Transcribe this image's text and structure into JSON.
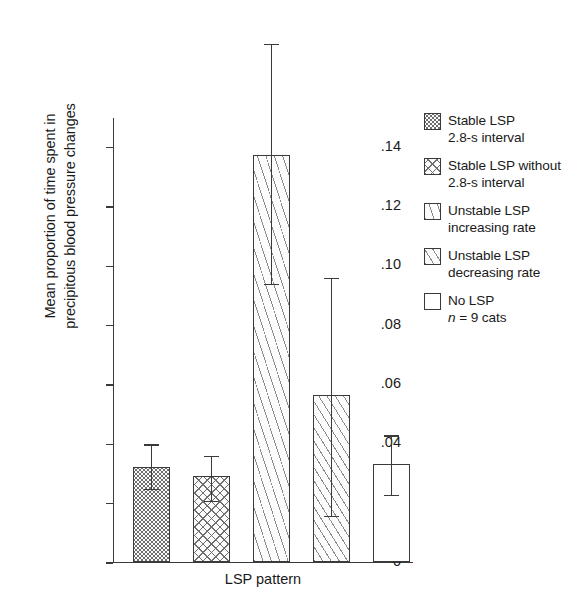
{
  "chart_data": {
    "type": "bar",
    "title": "",
    "xlabel": "LSP pattern",
    "ylabel": "Mean proportion of time spent in\nprecipitous blood pressure changes",
    "categories": [
      "Stable LSP 2.8-s interval",
      "Stable LSP without 2.8-s interval",
      "Unstable LSP increasing rate",
      "Unstable LSP decreasing rate",
      "No LSP"
    ],
    "values": [
      0.032,
      0.029,
      0.137,
      0.056,
      0.033
    ],
    "error_upper": [
      0.04,
      0.036,
      0.175,
      0.096,
      0.043
    ],
    "error_lower": [
      0.025,
      0.021,
      0.094,
      0.016,
      0.023
    ],
    "ylim": [
      0,
      0.15
    ],
    "ytick_values": [
      0,
      0.02,
      0.04,
      0.06,
      0.08,
      0.1,
      0.12,
      0.14
    ],
    "ytick_labels": [
      "0",
      ".02",
      ".04",
      ".06",
      ".08",
      ".10",
      ".12",
      ".14"
    ],
    "grid": false,
    "legend_position": "right",
    "patterns": [
      "dots",
      "cross-hatch",
      "diagonal-steep",
      "diagonal-shallow",
      "none"
    ],
    "sample_note": "n = 9 cats"
  },
  "axes": {
    "y_title": "Mean proportion of time spent in\nprecipitous blood pressure changes",
    "x_title": "LSP pattern",
    "ticks": [
      {
        "label": ".14",
        "value": 0.14
      },
      {
        "label": ".12",
        "value": 0.12
      },
      {
        "label": ".10",
        "value": 0.1
      },
      {
        "label": ".08",
        "value": 0.08
      },
      {
        "label": ".06",
        "value": 0.06
      },
      {
        "label": ".04",
        "value": 0.04
      },
      {
        "label": ".02",
        "value": 0.02
      },
      {
        "label": "0",
        "value": 0
      }
    ]
  },
  "legend": {
    "items": [
      {
        "line1": "Stable LSP",
        "line2": "2.8-s interval",
        "pattern": "dots"
      },
      {
        "line1": "Stable LSP without",
        "line2": "2.8-s interval",
        "pattern": "cross-hatch"
      },
      {
        "line1": "Unstable LSP",
        "line2": "increasing rate",
        "pattern": "diagonal-steep"
      },
      {
        "line1": "Unstable LSP",
        "line2": "decreasing rate",
        "pattern": "diagonal-shallow"
      },
      {
        "line1": "No LSP",
        "line2": "n = 9 cats",
        "pattern": "none"
      }
    ]
  },
  "colors": {
    "ink": "#1a1a1a",
    "axis": "#3a3a3a",
    "hatch": "#6e6e6e",
    "background": "#ffffff"
  }
}
